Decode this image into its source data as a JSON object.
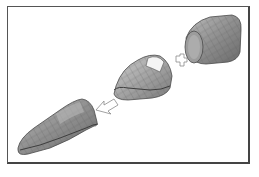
{
  "diagram": {
    "title": "",
    "parts": [
      {
        "id": "aft-section",
        "label": "",
        "position": "top-right"
      },
      {
        "id": "mid-section",
        "label": "",
        "position": "center"
      },
      {
        "id": "assembled-nose-section",
        "label": "",
        "position": "bottom-left"
      }
    ],
    "symbols": [
      {
        "type": "plus",
        "between": [
          "mid-section",
          "aft-section"
        ]
      },
      {
        "type": "arrow-left-down",
        "from": "mid-section",
        "to": "assembled-nose-section"
      }
    ],
    "colors": {
      "frame_border": "#555555",
      "part_fill_light": "#a8a8a8",
      "part_fill_dark": "#6e6e6e",
      "part_stroke": "#4a4a4a",
      "symbol_stroke": "#8a8a8a"
    }
  }
}
